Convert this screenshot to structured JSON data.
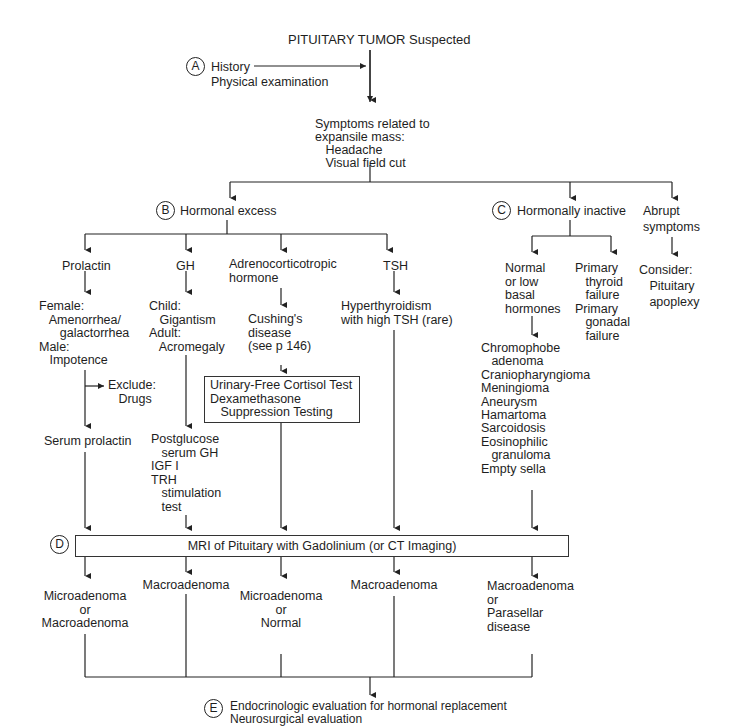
{
  "title": "PITUITARY TUMOR Suspected",
  "step_a": {
    "label": "A",
    "lines": [
      "History",
      "Physical examination"
    ]
  },
  "symptoms": {
    "lines": [
      "Symptoms related to",
      "expansile mass:",
      "   Headache",
      "   Visual field cut"
    ]
  },
  "step_b": {
    "label": "B",
    "text": "Hormonal excess"
  },
  "step_c": {
    "label": "C",
    "text": "Hormonally inactive"
  },
  "abrupt": {
    "text": "Abrupt\nsymptoms",
    "consider": "Consider:\n   Pituitary\n   apoplexy"
  },
  "prolactin": {
    "title": "Prolactin",
    "findings": "Female:\n   Amenorrhea/\n      galactorrhea\nMale:\n   Impotence",
    "exclude": "Exclude:\n   Drugs",
    "test": "Serum prolactin"
  },
  "gh": {
    "title": "GH",
    "findings": "Child:\n   Gigantism\nAdult:\n   Acromegaly",
    "test": "Postglucose\n   serum GH\nIGF I\nTRH\n   stimulation\n   test"
  },
  "acth": {
    "title": "Adrenocorticotropic\nhormone",
    "findings": "Cushing's\ndisease\n(see p 146)",
    "test_box": "Urinary-Free Cortisol Test\nDexamethasone\n   Suppression Testing"
  },
  "tsh": {
    "title": "TSH",
    "findings": "Hyperthyroidism\nwith high TSH (rare)"
  },
  "inactive": {
    "normal": "Normal\nor low\nbasal\nhormones",
    "primary": "Primary\n   thyroid\n   failure\nPrimary\n   gonadal\n   failure",
    "differential": "Chromophobe\n   adenoma\nCraniopharyngioma\nMeningioma\nAneurysm\nHamartoma\nSarcoidosis\nEosinophilic\n   granuloma\nEmpty sella"
  },
  "step_d": {
    "label": "D",
    "text": "MRI of Pituitary with Gadolinium (or CT Imaging)"
  },
  "results": [
    "Microadenoma\nor\nMacroadenoma",
    "Macroadenoma",
    "Microadenoma\nor\nNormal",
    "Macroadenoma",
    "Macroadenoma\nor\nParasellar\ndisease"
  ],
  "step_e": {
    "label": "E",
    "lines": [
      "Endocrinologic evaluation for hormonal replacement",
      "Neurosurgical evaluation"
    ]
  }
}
